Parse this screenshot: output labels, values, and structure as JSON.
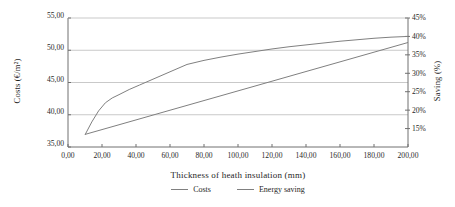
{
  "chart_data": {
    "type": "line",
    "title": "",
    "xlabel": "Thickness  of heath insulation  (mm)",
    "ylabel": "Costs (€/m²)",
    "y2label": "Saving (%)",
    "xlim": [
      0,
      200
    ],
    "ylim": [
      35,
      55
    ],
    "y2lim": [
      10,
      45
    ],
    "grid": true,
    "legend_position": "bottom",
    "x_ticks": [
      "0,00",
      "20,00",
      "40,00",
      "60,00",
      "80,00",
      "100,00",
      "120,00",
      "140,00",
      "160,00",
      "180,00",
      "200,00"
    ],
    "x_tick_values": [
      0,
      20,
      40,
      60,
      80,
      100,
      120,
      140,
      160,
      180,
      200
    ],
    "y_ticks": [
      "35,00",
      "40,00",
      "45,00",
      "50,00",
      "55,00"
    ],
    "y_tick_values": [
      35,
      40,
      45,
      50,
      55
    ],
    "y2_ticks": [
      "15%",
      "20%",
      "25%",
      "30%",
      "35%",
      "40%",
      "45%"
    ],
    "y2_tick_values": [
      15,
      20,
      25,
      30,
      35,
      40,
      45
    ],
    "series": [
      {
        "name": "Costs",
        "axis": "left",
        "color": "#808080",
        "x": [
          10,
          20,
          30,
          40,
          50,
          60,
          70,
          80,
          90,
          100,
          110,
          120,
          130,
          140,
          150,
          160,
          170,
          180,
          190,
          200
        ],
        "values": [
          36.95,
          37.7,
          38.45,
          39.2,
          39.95,
          40.7,
          41.45,
          42.2,
          42.95,
          43.7,
          44.45,
          45.2,
          45.95,
          46.7,
          47.45,
          48.2,
          48.95,
          49.7,
          50.45,
          51.2
        ]
      },
      {
        "name": "Energy saving",
        "axis": "right",
        "color": "#808080",
        "x": [
          10,
          14,
          18,
          22,
          26,
          30,
          36,
          42,
          50,
          60,
          70,
          80,
          90,
          100,
          110,
          120,
          130,
          140,
          150,
          160,
          170,
          180,
          190,
          200
        ],
        "values": [
          13.3,
          16.8,
          19.8,
          22.0,
          23.3,
          24.2,
          25.6,
          26.8,
          28.4,
          30.4,
          32.4,
          33.5,
          34.4,
          35.2,
          35.9,
          36.6,
          37.2,
          37.7,
          38.2,
          38.7,
          39.1,
          39.5,
          39.8,
          40.0
        ]
      }
    ]
  },
  "legend": {
    "items": [
      {
        "label": "Costs"
      },
      {
        "label": "Energy saving"
      }
    ]
  }
}
